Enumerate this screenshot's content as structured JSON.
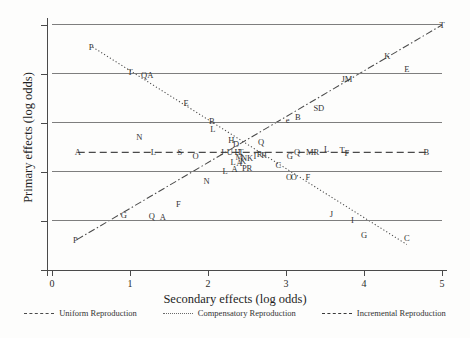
{
  "axes": {
    "xlabel": "Secondary effects (log odds)",
    "ylabel": "Primary effects (log odds)",
    "xticks": [
      "0",
      "1",
      "2",
      "3",
      "4",
      "5"
    ],
    "yticks": [
      "0",
      "1",
      "2",
      "3",
      "4",
      "5"
    ]
  },
  "legend": {
    "items": [
      {
        "label": "Uniform Reproduction",
        "style": "dash-dot",
        "color": "#4a4a4a"
      },
      {
        "label": "Compensatory Reproduction",
        "style": "dotted",
        "color": "#6a6a6a"
      },
      {
        "label": "Incremental Reproduction",
        "style": "dashed",
        "color": "#3a3a3a"
      }
    ]
  },
  "chart_data": {
    "type": "scatter",
    "title": "",
    "xlabel": "Secondary effects (log odds)",
    "ylabel": "Primary effects (log odds)",
    "xlim": [
      0,
      5.2
    ],
    "ylim": [
      0,
      5.2
    ],
    "grid": true,
    "legend_position": "bottom",
    "point_label_field": "label",
    "series": [
      {
        "name": "Uniform Reproduction",
        "line_style": "dash-dot",
        "line": {
          "x0": 0.32,
          "y0": 0.62,
          "x1": 5.0,
          "y1": 5.0
        },
        "points": [
          {
            "label": "P",
            "x": 0.3,
            "y": 0.62
          },
          {
            "label": "G",
            "x": 0.92,
            "y": 1.12
          },
          {
            "label": "Q",
            "x": 1.28,
            "y": 1.1
          },
          {
            "label": "A",
            "x": 1.42,
            "y": 1.08
          },
          {
            "label": "F",
            "x": 1.62,
            "y": 1.35
          },
          {
            "label": "N",
            "x": 1.98,
            "y": 1.82
          },
          {
            "label": "L",
            "x": 2.22,
            "y": 2.03
          },
          {
            "label": "A",
            "x": 2.34,
            "y": 2.06
          },
          {
            "label": "K",
            "x": 2.45,
            "y": 2.22
          },
          {
            "label": "M",
            "x": 2.4,
            "y": 2.3
          },
          {
            "label": "R",
            "x": 2.66,
            "y": 2.36
          },
          {
            "label": "Q",
            "x": 2.68,
            "y": 2.62
          },
          {
            "label": "e",
            "x": 3.02,
            "y": 3.06
          },
          {
            "label": "B",
            "x": 3.15,
            "y": 3.12
          },
          {
            "label": "SD",
            "x": 3.42,
            "y": 3.3
          },
          {
            "label": "JM",
            "x": 3.78,
            "y": 3.9
          },
          {
            "label": "K",
            "x": 4.3,
            "y": 4.36
          },
          {
            "label": "E",
            "x": 4.55,
            "y": 4.1
          },
          {
            "label": "T",
            "x": 5.0,
            "y": 5.0
          }
        ]
      },
      {
        "name": "Compensatory Reproduction",
        "line_style": "dotted",
        "line": {
          "x0": 0.52,
          "y0": 4.55,
          "x1": 4.55,
          "y1": 0.52
        },
        "points": [
          {
            "label": "P",
            "x": 0.5,
            "y": 4.55
          },
          {
            "label": "T",
            "x": 1.0,
            "y": 4.05
          },
          {
            "label": "QA",
            "x": 1.22,
            "y": 3.98
          },
          {
            "label": "E",
            "x": 1.72,
            "y": 3.4
          },
          {
            "label": "B",
            "x": 2.05,
            "y": 3.05
          },
          {
            "label": "L",
            "x": 2.06,
            "y": 2.88
          },
          {
            "label": "H",
            "x": 2.3,
            "y": 2.66
          },
          {
            "label": "D",
            "x": 2.36,
            "y": 2.58
          },
          {
            "label": "U",
            "x": 2.28,
            "y": 2.4
          },
          {
            "label": "H",
            "x": 2.38,
            "y": 2.4
          },
          {
            "label": "L",
            "x": 2.32,
            "y": 2.2
          },
          {
            "label": "A",
            "x": 2.4,
            "y": 2.18
          },
          {
            "label": "NK",
            "x": 2.5,
            "y": 2.28
          },
          {
            "label": "PR",
            "x": 2.5,
            "y": 2.08
          },
          {
            "label": "I",
            "x": 2.6,
            "y": 2.32
          },
          {
            "label": "R",
            "x": 2.72,
            "y": 2.35
          },
          {
            "label": "C",
            "x": 2.9,
            "y": 2.15
          },
          {
            "label": "O",
            "x": 3.1,
            "y": 1.9
          },
          {
            "label": "J",
            "x": 3.58,
            "y": 1.15
          },
          {
            "label": "I",
            "x": 3.85,
            "y": 1.02
          },
          {
            "label": "G",
            "x": 4.0,
            "y": 0.72
          },
          {
            "label": "C",
            "x": 4.55,
            "y": 0.65
          }
        ]
      },
      {
        "name": "Incremental Reproduction",
        "line_style": "dashed",
        "line": {
          "x0": 0.33,
          "y0": 2.4,
          "x1": 4.8,
          "y1": 2.4
        },
        "points": [
          {
            "label": "A",
            "x": 0.33,
            "y": 2.4
          },
          {
            "label": "N",
            "x": 1.12,
            "y": 2.72
          },
          {
            "label": "L",
            "x": 1.3,
            "y": 2.4
          },
          {
            "label": "S",
            "x": 1.64,
            "y": 2.4
          },
          {
            "label": "O",
            "x": 1.84,
            "y": 2.32
          },
          {
            "label": "J",
            "x": 2.18,
            "y": 2.4
          },
          {
            "label": "T",
            "x": 2.42,
            "y": 2.4
          },
          {
            "label": "Q",
            "x": 3.14,
            "y": 2.4
          },
          {
            "label": "G",
            "x": 3.05,
            "y": 2.33
          },
          {
            "label": "MR",
            "x": 3.34,
            "y": 2.4
          },
          {
            "label": "L",
            "x": 3.52,
            "y": 2.46
          },
          {
            "label": "T",
            "x": 3.72,
            "y": 2.44
          },
          {
            "label": "F",
            "x": 3.78,
            "y": 2.38
          },
          {
            "label": "O",
            "x": 3.04,
            "y": 1.9
          },
          {
            "label": "F",
            "x": 3.28,
            "y": 1.9
          },
          {
            "label": "B",
            "x": 4.8,
            "y": 2.4
          }
        ]
      }
    ]
  }
}
